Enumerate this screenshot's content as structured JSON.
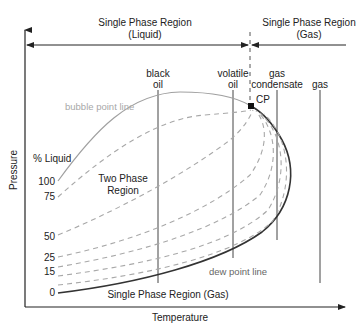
{
  "diagram": {
    "type": "pressure-temperature phase envelope",
    "regions": {
      "liquid_top": {
        "line1": "Single Phase Region",
        "line2": "(Liquid)"
      },
      "gas_top": {
        "line1": "Single Phase Region",
        "line2": "(Gas)"
      },
      "two_phase": {
        "line1": "Two Phase",
        "line2": "Region"
      },
      "gas_bottom": "Single Phase Region (Gas)"
    },
    "axes": {
      "x_label": "Temperature",
      "y_label": "Pressure"
    },
    "curves": {
      "bubble_point": "bubble point line",
      "dew_point": "dew point line",
      "critical_point": "CP"
    },
    "liquid_percent": {
      "title": "% Liquid",
      "values": [
        "100",
        "75",
        "50",
        "25",
        "15",
        "0"
      ]
    },
    "fluid_types": [
      {
        "line1": "black",
        "line2": "oil"
      },
      {
        "line1": "volatile",
        "line2": "oil"
      },
      {
        "line1": "gas",
        "line2": "condensate"
      },
      {
        "line1": "",
        "line2": "gas"
      }
    ],
    "colors": {
      "axis": "#222222",
      "bubble_line": "#a0a0a0",
      "dew_line": "#333333",
      "quality_lines": "#a8a8a8"
    }
  }
}
